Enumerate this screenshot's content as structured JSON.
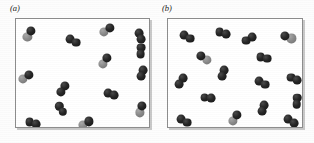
{
  "figure": {
    "background_color": "#fdfdfd",
    "border_color": "#8d8d8d",
    "atom_dark_color": "#1f1f1f",
    "atom_gray_color": "#8a8a8a",
    "width": 314,
    "height": 143
  },
  "panels": [
    {
      "label": "(a)",
      "label_x": 10,
      "label_y": 3,
      "box": {
        "x": 15,
        "y": 18,
        "w": 135,
        "h": 110
      },
      "molecule_count": 14,
      "molecules": [
        {
          "x": 28,
          "y": 33,
          "angle": 118,
          "bond": 7.0,
          "r": 4.6,
          "second_atom": "gray"
        },
        {
          "x": 72,
          "y": 40,
          "angle": 28,
          "bond": 7.0,
          "r": 4.4,
          "second_atom": "dark"
        },
        {
          "x": 106,
          "y": 29,
          "angle": 150,
          "bond": 7.2,
          "r": 4.6,
          "second_atom": "gray"
        },
        {
          "x": 139,
          "y": 35,
          "angle": 70,
          "bond": 6.8,
          "r": 4.4,
          "second_atom": "dark"
        },
        {
          "x": 104,
          "y": 60,
          "angle": 128,
          "bond": 7.2,
          "r": 4.6,
          "second_atom": "gray"
        },
        {
          "x": 25,
          "y": 76,
          "angle": 142,
          "bond": 7.0,
          "r": 4.6,
          "second_atom": "gray"
        },
        {
          "x": 141,
          "y": 72,
          "angle": 104,
          "bond": 6.8,
          "r": 4.4,
          "second_atom": "dark"
        },
        {
          "x": 62,
          "y": 88,
          "angle": 122,
          "bond": 7.0,
          "r": 4.6,
          "second_atom": "dark"
        },
        {
          "x": 110,
          "y": 93,
          "angle": 22,
          "bond": 7.0,
          "r": 4.4,
          "second_atom": "dark"
        },
        {
          "x": 140,
          "y": 108,
          "angle": 108,
          "bond": 7.2,
          "r": 4.6,
          "second_atom": "gray"
        },
        {
          "x": 32,
          "y": 122,
          "angle": 14,
          "bond": 7.0,
          "r": 4.4,
          "second_atom": "dark"
        },
        {
          "x": 85,
          "y": 122,
          "angle": 152,
          "bond": 7.2,
          "r": 4.6,
          "second_atom": "gray"
        },
        {
          "x": 140,
          "y": 50,
          "angle": 96,
          "bond": 6.8,
          "r": 4.4,
          "second_atom": "dark"
        },
        {
          "x": 60,
          "y": 108,
          "angle": 60,
          "bond": 6.6,
          "r": 4.2,
          "second_atom": "dark"
        }
      ]
    },
    {
      "label": "(b)",
      "label_x": 162,
      "label_y": 3,
      "box": {
        "x": 167,
        "y": 18,
        "w": 136,
        "h": 110
      },
      "molecule_count": 16,
      "molecules": [
        {
          "x": 186,
          "y": 36,
          "angle": 28,
          "bond": 7.0,
          "r": 4.4,
          "second_atom": "dark"
        },
        {
          "x": 222,
          "y": 32,
          "angle": 12,
          "bond": 7.0,
          "r": 4.4,
          "second_atom": "dark"
        },
        {
          "x": 248,
          "y": 38,
          "angle": 152,
          "bond": 7.0,
          "r": 4.4,
          "second_atom": "dark"
        },
        {
          "x": 287,
          "y": 36,
          "angle": 22,
          "bond": 7.2,
          "r": 4.6,
          "second_atom": "gray"
        },
        {
          "x": 203,
          "y": 57,
          "angle": 35,
          "bond": 7.2,
          "r": 4.6,
          "second_atom": "gray"
        },
        {
          "x": 263,
          "y": 57,
          "angle": 10,
          "bond": 7.0,
          "r": 4.4,
          "second_atom": "dark"
        },
        {
          "x": 180,
          "y": 80,
          "angle": 120,
          "bond": 7.0,
          "r": 4.4,
          "second_atom": "dark"
        },
        {
          "x": 222,
          "y": 72,
          "angle": 112,
          "bond": 7.0,
          "r": 4.4,
          "second_atom": "dark"
        },
        {
          "x": 261,
          "y": 82,
          "angle": 28,
          "bond": 7.0,
          "r": 4.4,
          "second_atom": "dark"
        },
        {
          "x": 293,
          "y": 78,
          "angle": 25,
          "bond": 7.0,
          "r": 4.4,
          "second_atom": "dark"
        },
        {
          "x": 207,
          "y": 97,
          "angle": 8,
          "bond": 7.0,
          "r": 4.4,
          "second_atom": "dark"
        },
        {
          "x": 262,
          "y": 107,
          "angle": 112,
          "bond": 7.0,
          "r": 4.4,
          "second_atom": "dark"
        },
        {
          "x": 183,
          "y": 120,
          "angle": 28,
          "bond": 7.0,
          "r": 4.4,
          "second_atom": "dark"
        },
        {
          "x": 234,
          "y": 117,
          "angle": 128,
          "bond": 7.2,
          "r": 4.6,
          "second_atom": "gray"
        },
        {
          "x": 290,
          "y": 120,
          "angle": 38,
          "bond": 7.0,
          "r": 4.4,
          "second_atom": "dark"
        },
        {
          "x": 296,
          "y": 100,
          "angle": 95,
          "bond": 6.8,
          "r": 4.3,
          "second_atom": "dark"
        }
      ]
    }
  ]
}
